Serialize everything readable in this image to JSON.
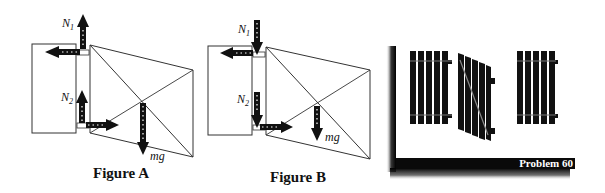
{
  "figures": [
    {
      "id": "A",
      "caption": "Figure A",
      "labels": {
        "n1": "N",
        "n1_sub": "1",
        "n2": "N",
        "n2_sub": "2",
        "weight": "mg"
      },
      "arrows": {
        "n1": "up",
        "n2": "up",
        "top_horizontal": "left",
        "bottom_horizontal": "right",
        "weight": "down"
      }
    },
    {
      "id": "B",
      "caption": "Figure B",
      "labels": {
        "n1": "N",
        "n1_sub": "1",
        "n2": "N",
        "n2_sub": "2",
        "weight": "mg"
      },
      "arrows": {
        "n1": "down",
        "n2": "down",
        "top_horizontal": "left",
        "bottom_horizontal": "right",
        "weight": "down"
      }
    }
  ],
  "illustration": {
    "description": "fence with hinged gate",
    "banner": "Problem 60"
  },
  "colors": {
    "ink": "#111111",
    "banner_bg": "#0a0a0a",
    "banner_text": "#ffffff"
  }
}
